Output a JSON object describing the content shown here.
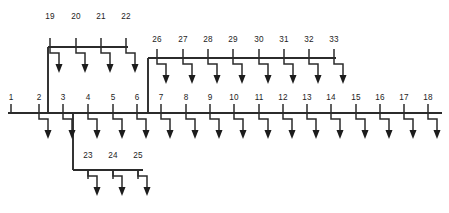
{
  "diagram": {
    "type": "single-line-feeder-diagram",
    "line_color": "#2b2b2b",
    "label_color": "#1c1c1c",
    "background_color": "#ffffff",
    "node_label_font_size": 8.2
  },
  "main_feeder": {
    "name": "main-feeder-bus",
    "y": 113,
    "x_start": 8,
    "x_end": 442,
    "nodes": [
      {
        "id": "1",
        "label": "1",
        "x": 11,
        "has_load": false,
        "label_y": 100
      },
      {
        "id": "2",
        "label": "2",
        "x": 39,
        "has_load": true,
        "label_y": 100
      },
      {
        "id": "3",
        "label": "3",
        "x": 63,
        "has_load": true,
        "label_y": 100
      },
      {
        "id": "4",
        "label": "4",
        "x": 88,
        "has_load": true,
        "label_y": 100
      },
      {
        "id": "5",
        "label": "5",
        "x": 113,
        "has_load": true,
        "label_y": 100
      },
      {
        "id": "6",
        "label": "6",
        "x": 137,
        "has_load": true,
        "label_y": 100
      },
      {
        "id": "7",
        "label": "7",
        "x": 161,
        "has_load": true,
        "label_y": 100
      },
      {
        "id": "8",
        "label": "8",
        "x": 186,
        "has_load": true,
        "label_y": 100
      },
      {
        "id": "9",
        "label": "9",
        "x": 210,
        "has_load": true,
        "label_y": 100
      },
      {
        "id": "10",
        "label": "10",
        "x": 234,
        "has_load": true,
        "label_y": 100
      },
      {
        "id": "11",
        "label": "11",
        "x": 259,
        "has_load": true,
        "label_y": 100
      },
      {
        "id": "12",
        "label": "12",
        "x": 283,
        "has_load": true,
        "label_y": 100
      },
      {
        "id": "13",
        "label": "13",
        "x": 307,
        "has_load": true,
        "label_y": 100
      },
      {
        "id": "14",
        "label": "14",
        "x": 331,
        "has_load": true,
        "label_y": 100
      },
      {
        "id": "15",
        "label": "15",
        "x": 356,
        "has_load": true,
        "label_y": 100
      },
      {
        "id": "16",
        "label": "16",
        "x": 380,
        "has_load": true,
        "label_y": 100
      },
      {
        "id": "17",
        "label": "17",
        "x": 404,
        "has_load": true,
        "label_y": 100
      },
      {
        "id": "18",
        "label": "18",
        "x": 428,
        "has_load": true,
        "label_y": 100
      }
    ]
  },
  "branches": [
    {
      "name": "upper-left-branch",
      "orientation": "above",
      "bus_y": 47,
      "bus_x_start": 48,
      "bus_x_end": 128,
      "riser": {
        "from_node": "2",
        "from_x": 39,
        "from_y": 113,
        "corner_x": 48,
        "to_y": 47
      },
      "nodes": [
        {
          "id": "19",
          "label": "19",
          "x": 50,
          "has_load": true,
          "label_y": 19
        },
        {
          "id": "20",
          "label": "20",
          "x": 76,
          "has_load": true,
          "label_y": 19
        },
        {
          "id": "21",
          "label": "21",
          "x": 101,
          "has_load": true,
          "label_y": 19
        },
        {
          "id": "22",
          "label": "22",
          "x": 126,
          "has_load": true,
          "label_y": 19
        }
      ]
    },
    {
      "name": "upper-right-branch",
      "orientation": "above",
      "bus_y": 58,
      "bus_x_start": 148,
      "bus_x_end": 336,
      "riser": {
        "from_node": "6",
        "from_x": 137,
        "from_y": 113,
        "corner_x": 148,
        "to_y": 58
      },
      "nodes": [
        {
          "id": "26",
          "label": "26",
          "x": 157,
          "has_load": true,
          "label_y": 42
        },
        {
          "id": "27",
          "label": "27",
          "x": 183,
          "has_load": true,
          "label_y": 42
        },
        {
          "id": "28",
          "label": "28",
          "x": 208,
          "has_load": true,
          "label_y": 42
        },
        {
          "id": "29",
          "label": "29",
          "x": 233,
          "has_load": true,
          "label_y": 42
        },
        {
          "id": "30",
          "label": "30",
          "x": 259,
          "has_load": true,
          "label_y": 42
        },
        {
          "id": "31",
          "label": "31",
          "x": 284,
          "has_load": true,
          "label_y": 42
        },
        {
          "id": "32",
          "label": "32",
          "x": 309,
          "has_load": true,
          "label_y": 42
        },
        {
          "id": "33",
          "label": "33",
          "x": 334,
          "has_load": true,
          "label_y": 42
        }
      ]
    },
    {
      "name": "lower-branch",
      "orientation": "below",
      "bus_y": 170,
      "bus_x_start": 73,
      "bus_x_end": 143,
      "riser": {
        "from_node": "3",
        "from_x": 63,
        "from_y": 113,
        "corner_x": 73,
        "to_y": 170
      },
      "nodes": [
        {
          "id": "23",
          "label": "23",
          "x": 88,
          "has_load": true,
          "label_y": 158
        },
        {
          "id": "24",
          "label": "24",
          "x": 113,
          "has_load": true,
          "label_y": 158
        },
        {
          "id": "25",
          "label": "25",
          "x": 138,
          "has_load": true,
          "label_y": 158
        }
      ]
    }
  ],
  "load_symbol": {
    "name": "load-arrow",
    "description": "stepped stem descending from bus terminating in solid down arrowhead",
    "stem_run": 10,
    "stem_drop_first": 10,
    "stem_drop_second": 16,
    "head_width": 7,
    "head_height": 8
  }
}
